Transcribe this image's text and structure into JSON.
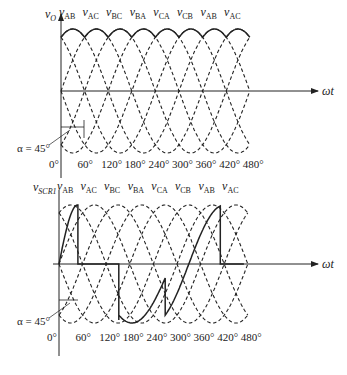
{
  "figure": {
    "panels": [
      {
        "id": "top",
        "ylabel": "v",
        "ylabel_sub": "O",
        "xlabel": "ωt",
        "phase_labels": [
          {
            "v": "v",
            "sub": "AB"
          },
          {
            "v": "v",
            "sub": "AC"
          },
          {
            "v": "v",
            "sub": "BC"
          },
          {
            "v": "v",
            "sub": "BA"
          },
          {
            "v": "v",
            "sub": "CA"
          },
          {
            "v": "v",
            "sub": "CB"
          },
          {
            "v": "v",
            "sub": "AB"
          },
          {
            "v": "v",
            "sub": "AC"
          }
        ],
        "tick_labels": [
          "0°",
          "60°",
          "120°",
          "180°",
          "240°",
          "300°",
          "360°",
          "420°",
          "480°"
        ],
        "alpha_label": "α = 45°"
      },
      {
        "id": "bottom",
        "ylabel": "v",
        "ylabel_sub": "SCR1",
        "xlabel": "ωt",
        "phase_labels": [
          {
            "v": "v",
            "sub": "AB"
          },
          {
            "v": "v",
            "sub": "AC"
          },
          {
            "v": "v",
            "sub": "BC"
          },
          {
            "v": "v",
            "sub": "BA"
          },
          {
            "v": "v",
            "sub": "CA"
          },
          {
            "v": "v",
            "sub": "CB"
          },
          {
            "v": "v",
            "sub": "AB"
          },
          {
            "v": "v",
            "sub": "AC"
          }
        ],
        "tick_labels": [
          "0°",
          "60°",
          "120°",
          "180°",
          "240°",
          "300°",
          "360°",
          "420°",
          "480°"
        ],
        "alpha_label": "α = 45°"
      }
    ],
    "colors": {
      "ink": "#222222",
      "background": "#ffffff"
    }
  },
  "chart_data": [
    {
      "type": "line",
      "title": "Output voltage v_O, three-phase controlled rectifier, α = 45°",
      "xlabel": "ωt",
      "ylabel": "v_O",
      "x_ticks_deg": [
        0,
        60,
        120,
        180,
        240,
        300,
        360,
        420,
        480
      ],
      "series": [
        {
          "name": "line-to-line voltages (dashed)",
          "style": "dashed",
          "phases": [
            "v_AB",
            "v_AC",
            "v_BC",
            "v_BA",
            "v_CA",
            "v_CB",
            "v_AB",
            "v_AC"
          ]
        },
        {
          "name": "v_O (solid)",
          "style": "solid",
          "description": "each 60° segment follows a line voltage from its 45° delayed firing until the next SCR fires"
        }
      ],
      "annotations": [
        "α = 45°"
      ]
    },
    {
      "type": "line",
      "title": "SCR1 voltage v_SCR1, α = 45°",
      "xlabel": "ωt",
      "ylabel": "v_SCR1",
      "x_ticks_deg": [
        0,
        60,
        120,
        180,
        240,
        300,
        360,
        420,
        480
      ],
      "series": [
        {
          "name": "line-to-line voltages (dashed)",
          "style": "dashed"
        },
        {
          "name": "v_SCR1 (solid)",
          "style": "solid",
          "description": "follows v_AB up to 105°, zero while conducting (105°–225°), then follows v_BA and v_CA negative, rises with v_AB up to 465°, then zero"
        }
      ],
      "annotations": [
        "α = 45°"
      ]
    }
  ]
}
